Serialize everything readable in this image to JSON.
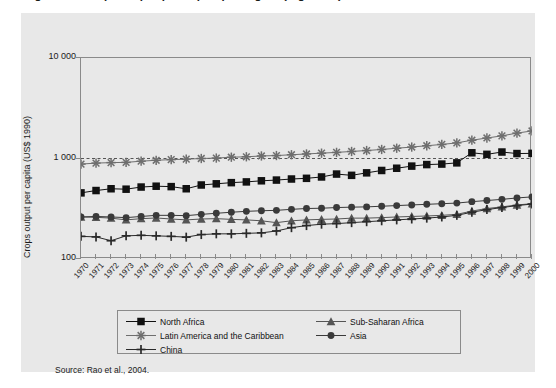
{
  "figure": {
    "title_cropped": "Figure 3.3  Crops output per capita per region (log scale)",
    "source": "Source: Rao et al., 2004.",
    "panel_bg": "#e8e8e8",
    "frame_color": "#8a8a8a"
  },
  "chart_data": {
    "type": "line",
    "title": "",
    "xlabel": "",
    "ylabel": "Crops output per capita (US$ 1990)",
    "yscale": "log",
    "ylim": [
      100,
      10000
    ],
    "yticks": [
      10000,
      1000,
      100
    ],
    "ytick_labels": [
      "10 000",
      "1 000",
      "100"
    ],
    "grid": false,
    "reference_line": {
      "value": 1000,
      "style": "dashed",
      "color": "#444444"
    },
    "legend_position": "below-plot",
    "x": [
      1970,
      1971,
      1972,
      1973,
      1974,
      1975,
      1976,
      1977,
      1978,
      1979,
      1980,
      1981,
      1982,
      1983,
      1984,
      1985,
      1986,
      1987,
      1988,
      1989,
      1990,
      1991,
      1992,
      1993,
      1994,
      1995,
      1996,
      1997,
      1998,
      1999,
      2000
    ],
    "series": [
      {
        "name": "North Africa",
        "marker": "square",
        "color": "#111111",
        "values": [
          455,
          480,
          500,
          495,
          520,
          530,
          525,
          500,
          545,
          560,
          575,
          585,
          600,
          610,
          625,
          635,
          655,
          700,
          680,
          720,
          760,
          800,
          840,
          870,
          880,
          905,
          1140,
          1100,
          1160,
          1120,
          1125
        ]
      },
      {
        "name": "Sub-Saharan Africa",
        "marker": "triangle",
        "color": "#555555",
        "values": [
          262,
          260,
          255,
          245,
          252,
          256,
          250,
          245,
          250,
          252,
          248,
          245,
          240,
          230,
          240,
          245,
          248,
          250,
          255,
          255,
          258,
          262,
          265,
          268,
          272,
          278,
          300,
          318,
          330,
          345,
          355
        ]
      },
      {
        "name": "Latin America and the Caribbean",
        "marker": "asterisk",
        "color": "#6e6e6e",
        "values": [
          880,
          900,
          910,
          915,
          940,
          960,
          975,
          985,
          1000,
          1010,
          1030,
          1040,
          1060,
          1070,
          1090,
          1110,
          1130,
          1150,
          1175,
          1200,
          1230,
          1265,
          1300,
          1340,
          1380,
          1430,
          1520,
          1600,
          1680,
          1790,
          1880
        ]
      },
      {
        "name": "Asia",
        "marker": "circle",
        "color": "#3a3a3a",
        "values": [
          262,
          265,
          262,
          258,
          265,
          272,
          272,
          270,
          278,
          285,
          292,
          298,
          302,
          305,
          312,
          318,
          320,
          325,
          328,
          330,
          335,
          340,
          345,
          350,
          355,
          360,
          372,
          382,
          392,
          405,
          415
        ]
      },
      {
        "name": "China",
        "marker": "plus",
        "color": "#2a2a2a",
        "values": [
          168,
          166,
          152,
          170,
          172,
          170,
          168,
          165,
          175,
          178,
          178,
          180,
          182,
          190,
          205,
          215,
          222,
          225,
          230,
          235,
          240,
          245,
          250,
          255,
          262,
          272,
          292,
          310,
          325,
          340,
          352
        ]
      }
    ]
  },
  "legend": {
    "items": [
      {
        "label": "North Africa",
        "marker": "square"
      },
      {
        "label": "Sub-Saharan Africa",
        "marker": "triangle"
      },
      {
        "label": "Latin America and the Caribbean",
        "marker": "asterisk"
      },
      {
        "label": "Asia",
        "marker": "circle"
      },
      {
        "label": "China",
        "marker": "plus"
      }
    ]
  }
}
